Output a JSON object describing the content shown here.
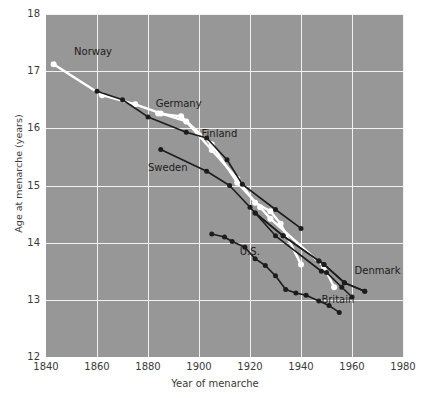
{
  "chart_data": {
    "type": "line",
    "title": "",
    "xlabel": "Year of menarche",
    "ylabel": "Age at menarche (years)",
    "xlim": [
      1840,
      1980
    ],
    "ylim": [
      12,
      18
    ],
    "xticks": [
      1840,
      1860,
      1880,
      1900,
      1920,
      1940,
      1960,
      1980
    ],
    "yticks": [
      12,
      13,
      14,
      15,
      16,
      17,
      18
    ],
    "grid": true,
    "legend_position": "inline-annotations",
    "background_color": "#979797",
    "grid_color": "#f2f2f2",
    "series": [
      {
        "name": "Norway",
        "color": "#ffffff",
        "marker_color": "#ffffff",
        "label_x": 1851,
        "label_y": 17.32,
        "points": [
          [
            1843,
            17.12
          ],
          [
            1862,
            16.58
          ],
          [
            1875,
            16.42
          ],
          [
            1885,
            16.26
          ],
          [
            1895,
            16.12
          ],
          [
            1905,
            15.62
          ],
          [
            1915,
            15.12
          ],
          [
            1922,
            14.7
          ],
          [
            1928,
            14.55
          ],
          [
            1932,
            14.33
          ],
          [
            1940,
            13.62
          ]
        ]
      },
      {
        "name": "Germany",
        "color": "#ffffff",
        "marker_color": "#ffffff",
        "label_x": 1883,
        "label_y": 16.4,
        "points": [
          [
            1884,
            16.26
          ],
          [
            1893,
            16.21
          ],
          [
            1905,
            15.72
          ],
          [
            1915,
            15.05
          ],
          [
            1924,
            14.62
          ],
          [
            1928,
            14.42
          ],
          [
            1949,
            13.58
          ],
          [
            1953,
            13.22
          ]
        ]
      },
      {
        "name": "Finland",
        "color": "#1c1c1c",
        "marker_color": "#1c1c1c",
        "label_x": 1901,
        "label_y": 15.88,
        "points": [
          [
            1860,
            16.65
          ],
          [
            1870,
            16.5
          ],
          [
            1880,
            16.2
          ],
          [
            1895,
            15.93
          ],
          [
            1903,
            15.83
          ],
          [
            1911,
            15.45
          ],
          [
            1917,
            15.02
          ],
          [
            1930,
            14.58
          ],
          [
            1940,
            14.25
          ]
        ]
      },
      {
        "name": "Sweden",
        "color": "#1c1c1c",
        "marker_color": "#1c1c1c",
        "label_x": 1880,
        "label_y": 15.28,
        "points": [
          [
            1885,
            15.63
          ],
          [
            1903,
            15.25
          ],
          [
            1912,
            15.0
          ],
          [
            1920,
            14.62
          ],
          [
            1930,
            14.12
          ],
          [
            1948,
            13.5
          ],
          [
            1950,
            13.48
          ],
          [
            1956,
            13.22
          ],
          [
            1960,
            13.05
          ]
        ]
      },
      {
        "name": "Denmark",
        "color": "#1c1c1c",
        "marker_color": "#1c1c1c",
        "label_x": 1961,
        "label_y": 13.48,
        "points": [
          [
            1922,
            14.52
          ],
          [
            1933,
            14.12
          ],
          [
            1947,
            13.68
          ],
          [
            1949,
            13.62
          ],
          [
            1957,
            13.3
          ],
          [
            1965,
            13.15
          ]
        ]
      },
      {
        "name": "U.S.",
        "color": "#1c1c1c",
        "marker_color": "#1c1c1c",
        "label_x": 1916,
        "label_y": 13.82,
        "points": [
          [
            1905,
            14.15
          ],
          [
            1910,
            14.1
          ],
          [
            1913,
            14.02
          ],
          [
            1918,
            13.92
          ],
          [
            1922,
            13.72
          ],
          [
            1926,
            13.6
          ],
          [
            1930,
            13.42
          ],
          [
            1934,
            13.18
          ],
          [
            1938,
            13.12
          ],
          [
            1942,
            13.08
          ],
          [
            1947,
            12.98
          ],
          [
            1951,
            12.9
          ],
          [
            1955,
            12.78
          ]
        ]
      },
      {
        "name": "Britain",
        "color": "#1c1c1c",
        "marker_color": "#1c1c1c",
        "label_x": 1948,
        "label_y": 12.98,
        "points": [
          [
            1922,
            14.52
          ],
          [
            1933,
            14.12
          ],
          [
            1947,
            13.68
          ],
          [
            1949,
            13.62
          ],
          [
            1957,
            13.3
          ],
          [
            1965,
            13.15
          ]
        ]
      }
    ],
    "annotations": [
      {
        "text": "Norway",
        "x": 1851,
        "y": 17.32
      },
      {
        "text": "Germany",
        "x": 1883,
        "y": 16.4
      },
      {
        "text": "Finland",
        "x": 1901,
        "y": 15.88
      },
      {
        "text": "Sweden",
        "x": 1880,
        "y": 15.28
      },
      {
        "text": "U.S.",
        "x": 1916,
        "y": 13.82
      },
      {
        "text": "Denmark",
        "x": 1961,
        "y": 13.48
      },
      {
        "text": "Britain",
        "x": 1948,
        "y": 12.98
      }
    ]
  }
}
